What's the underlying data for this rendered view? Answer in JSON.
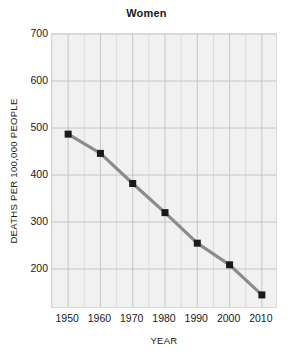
{
  "chart_data": {
    "type": "line",
    "title": "Women",
    "xlabel": "YEAR",
    "ylabel": "DEATHS PER 100,000 PEOPLE",
    "x": [
      1950,
      1960,
      1970,
      1980,
      1990,
      2000,
      2010
    ],
    "values": [
      487,
      446,
      382,
      320,
      255,
      209,
      145
    ],
    "xtick_labels": [
      "1950",
      "1960",
      "1970",
      "1980",
      "1990",
      "2000",
      "2010"
    ],
    "ytick_labels": [
      "700",
      "600",
      "500",
      "400",
      "300",
      "200"
    ],
    "ytick_values": [
      700,
      600,
      500,
      400,
      300,
      200
    ],
    "xlim": [
      1945,
      2015
    ],
    "ylim": [
      115,
      700
    ],
    "grid": true,
    "legend": "none",
    "marker": "square",
    "marker_color": "#1a1a1a",
    "line_color": "#8c8c8c",
    "plot_background": "#f1f1f1",
    "gridline_color": "#cfcfcf"
  }
}
